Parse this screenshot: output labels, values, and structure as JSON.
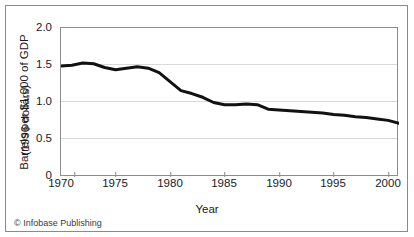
{
  "figure": {
    "credit": "© Infobase Publishing",
    "border_color": "#8a8a8a",
    "background": "#ffffff"
  },
  "chart_data": {
    "type": "line",
    "title": "",
    "subtitle": "",
    "xlabel": "Year",
    "ylabel": "Barrels per $1,000 of GDP (1996 dollars)",
    "ylabel_lines": [
      "Barrels per $1,000 of GDP",
      "(1996 dollars)"
    ],
    "xlim": [
      1970,
      2001
    ],
    "ylim": [
      0,
      2.0
    ],
    "grid": "horizontal",
    "legend": "none",
    "line_color": "#111111",
    "line_width": 3,
    "x_ticks": [
      1970,
      1975,
      1980,
      1985,
      1990,
      1995,
      2000
    ],
    "x_tick_labels": [
      "1970",
      "1975",
      "1980",
      "1985",
      "1990",
      "1995",
      "2000"
    ],
    "y_ticks": [
      0,
      0.5,
      1.0,
      1.5,
      2.0
    ],
    "y_tick_labels": [
      "0",
      "0.5",
      "1.0",
      "1.5",
      "2.0"
    ],
    "series": [
      {
        "name": "Energy intensity",
        "x": [
          1970,
          1971,
          1972,
          1973,
          1974,
          1975,
          1976,
          1977,
          1978,
          1979,
          1980,
          1981,
          1982,
          1983,
          1984,
          1985,
          1986,
          1987,
          1988,
          1989,
          1990,
          1991,
          1992,
          1993,
          1994,
          1995,
          1996,
          1997,
          1998,
          1999,
          2000,
          2001
        ],
        "values": [
          1.49,
          1.5,
          1.53,
          1.52,
          1.47,
          1.44,
          1.46,
          1.48,
          1.46,
          1.4,
          1.28,
          1.16,
          1.12,
          1.07,
          1.0,
          0.97,
          0.97,
          0.98,
          0.97,
          0.91,
          0.9,
          0.89,
          0.88,
          0.87,
          0.86,
          0.84,
          0.83,
          0.81,
          0.8,
          0.78,
          0.76,
          0.72
        ]
      }
    ]
  }
}
